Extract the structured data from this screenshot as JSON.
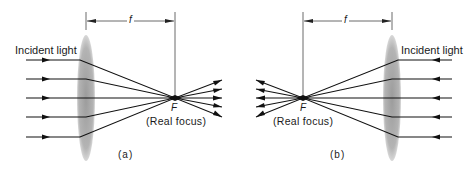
{
  "figure": {
    "panels": [
      {
        "id": "a",
        "caption": "(a)",
        "incident_label": "Incident light",
        "focal_length_label": "f",
        "focus_letter": "F",
        "focus_label": "(Real focus)",
        "light_direction": "left-to-right"
      },
      {
        "id": "b",
        "caption": "(b)",
        "incident_label": "Incident light",
        "focal_length_label": "f",
        "focus_letter": "F",
        "focus_label": "(Real focus)",
        "light_direction": "right-to-left"
      }
    ],
    "colors": {
      "lens": "#a8a8a8",
      "rays": "#111111",
      "dimension": "#444444"
    }
  }
}
